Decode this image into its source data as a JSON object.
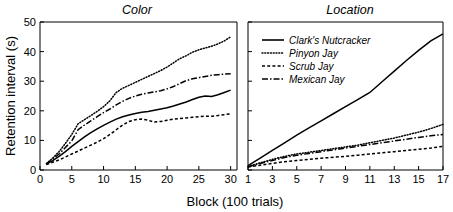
{
  "chart_data": {
    "type": "line",
    "title": "",
    "xlabel": "Block (100 trials)",
    "ylabel": "Retention interval (s)",
    "ylim": [
      0,
      50
    ],
    "yticks": [
      0,
      10,
      20,
      30,
      40,
      50
    ],
    "grid": false,
    "legend_position": "top-left of right panel",
    "panels": [
      {
        "title": "Color",
        "xlabel": "Block (100 trials)",
        "ylabel": "Retention interval (s)",
        "xlim": [
          0,
          31
        ],
        "xticks": [
          0,
          5,
          10,
          15,
          20,
          25,
          30
        ],
        "ylim": [
          0,
          50
        ],
        "yticks": [
          0,
          10,
          20,
          30,
          40,
          50
        ],
        "x": [
          1,
          2,
          3,
          4,
          5,
          6,
          7,
          8,
          9,
          10,
          11,
          12,
          13,
          14,
          15,
          16,
          17,
          18,
          19,
          20,
          21,
          22,
          23,
          24,
          25,
          26,
          27,
          28,
          29,
          30
        ],
        "series": [
          {
            "name": "Clark's Nutcracker",
            "style": "solid",
            "values": [
              2.0,
              3.2,
              4.6,
              6.2,
              8.0,
              9.6,
              11.2,
              12.6,
              13.9,
              15.1,
              16.2,
              17.2,
              18.0,
              18.6,
              19.1,
              19.5,
              19.8,
              20.2,
              20.6,
              21.0,
              21.6,
              22.3,
              23.0,
              23.8,
              24.6,
              25.0,
              24.8,
              25.4,
              26.2,
              27.0
            ]
          },
          {
            "name": "Pinyon Jay",
            "style": "dotted",
            "values": [
              2.2,
              4.0,
              6.2,
              9.0,
              12.0,
              15.6,
              17.0,
              18.4,
              19.8,
              21.4,
              23.4,
              26.2,
              27.6,
              28.6,
              29.6,
              30.6,
              31.6,
              32.6,
              33.6,
              34.8,
              36.2,
              37.6,
              38.6,
              39.8,
              40.6,
              41.2,
              41.8,
              42.6,
              43.6,
              45.0
            ]
          },
          {
            "name": "Scrub Jay",
            "style": "dashed",
            "values": [
              1.8,
              2.6,
              3.4,
              4.4,
              5.4,
              6.4,
              7.4,
              8.4,
              9.4,
              10.6,
              12.0,
              13.6,
              15.2,
              16.4,
              17.0,
              17.2,
              16.8,
              16.2,
              16.4,
              16.8,
              17.2,
              17.4,
              17.6,
              17.8,
              18.0,
              18.2,
              18.2,
              18.4,
              18.7,
              19.0
            ]
          },
          {
            "name": "Mexican Jay",
            "style": "dashdot",
            "values": [
              2.0,
              3.6,
              5.4,
              7.6,
              9.8,
              13.6,
              15.2,
              16.6,
              18.0,
              19.4,
              20.6,
              22.0,
              23.2,
              24.2,
              25.0,
              25.6,
              26.0,
              26.4,
              26.8,
              27.4,
              28.2,
              29.2,
              30.2,
              30.8,
              31.2,
              31.6,
              32.0,
              32.2,
              32.4,
              32.5
            ]
          }
        ]
      },
      {
        "title": "Location",
        "xlabel": "Block (100 trials)",
        "xlim": [
          1,
          17
        ],
        "xticks": [
          1,
          3,
          5,
          7,
          9,
          11,
          13,
          15,
          17
        ],
        "ylim": [
          0,
          50
        ],
        "yticks": [
          0,
          10,
          20,
          30,
          40,
          50
        ],
        "x": [
          1,
          2,
          3,
          4,
          5,
          6,
          7,
          8,
          9,
          10,
          11,
          12,
          13,
          14,
          15,
          16,
          17
        ],
        "series": [
          {
            "name": "Clark's Nutcracker",
            "style": "solid",
            "values": [
              1.5,
              4.0,
              6.6,
              9.2,
              11.8,
              14.2,
              16.6,
              19.0,
              21.4,
              23.8,
              26.2,
              29.8,
              33.4,
              37.0,
              40.4,
              43.6,
              46.0
            ]
          },
          {
            "name": "Pinyon Jay",
            "style": "dotted",
            "values": [
              1.2,
              2.4,
              3.6,
              4.6,
              5.4,
              6.0,
              6.6,
              7.2,
              7.8,
              8.4,
              9.2,
              10.0,
              10.8,
              11.8,
              12.8,
              14.0,
              15.4
            ]
          },
          {
            "name": "Scrub Jay",
            "style": "dashed",
            "values": [
              1.0,
              1.6,
              2.2,
              2.8,
              3.2,
              3.6,
              4.0,
              4.3,
              4.6,
              5.0,
              5.4,
              5.8,
              6.2,
              6.6,
              7.0,
              7.4,
              8.0
            ]
          },
          {
            "name": "Mexican Jay",
            "style": "dashdot",
            "values": [
              1.1,
              2.2,
              3.2,
              4.2,
              5.0,
              5.6,
              6.2,
              6.8,
              7.4,
              8.0,
              8.6,
              9.2,
              9.8,
              10.4,
              11.0,
              11.6,
              12.0
            ]
          }
        ]
      }
    ],
    "legend": [
      {
        "label": "Clark's Nutcracker",
        "style": "solid"
      },
      {
        "label": "Pinyon Jay",
        "style": "dotted"
      },
      {
        "label": "Scrub Jay",
        "style": "dashed"
      },
      {
        "label": "Mexican Jay",
        "style": "dashdot"
      }
    ]
  }
}
